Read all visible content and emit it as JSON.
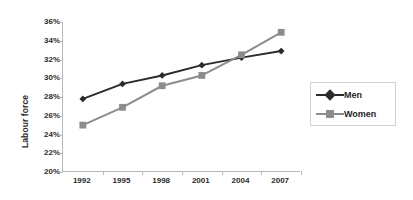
{
  "chart_data": {
    "type": "line",
    "title": "",
    "subtitle": "",
    "xlabel": "",
    "ylabel": "Labour force",
    "categories": [
      "1992",
      "1995",
      "1998",
      "2001",
      "2004",
      "2007"
    ],
    "ylim": [
      20,
      36
    ],
    "y_ticks": [
      20,
      22,
      24,
      26,
      28,
      30,
      32,
      34,
      36
    ],
    "y_tick_labels": [
      "20%",
      "22%",
      "24%",
      "26%",
      "28%",
      "30%",
      "32%",
      "34%",
      "36%"
    ],
    "y_unit": "%",
    "grid": false,
    "legend_position": "right",
    "series": [
      {
        "name": "Men",
        "color": "#2b2b2b",
        "marker": "diamond",
        "values": [
          27.8,
          29.4,
          30.3,
          31.4,
          32.2,
          32.9
        ]
      },
      {
        "name": "Women",
        "color": "#8c8c8c",
        "marker": "square",
        "values": [
          25.0,
          26.9,
          29.2,
          30.3,
          32.5,
          34.9
        ]
      }
    ]
  },
  "axis": {
    "line_color": "#b9b9b9",
    "text_color": "#2b2b2b"
  },
  "legend": {
    "entries": [
      {
        "label": "Men"
      },
      {
        "label": "Women"
      }
    ]
  }
}
